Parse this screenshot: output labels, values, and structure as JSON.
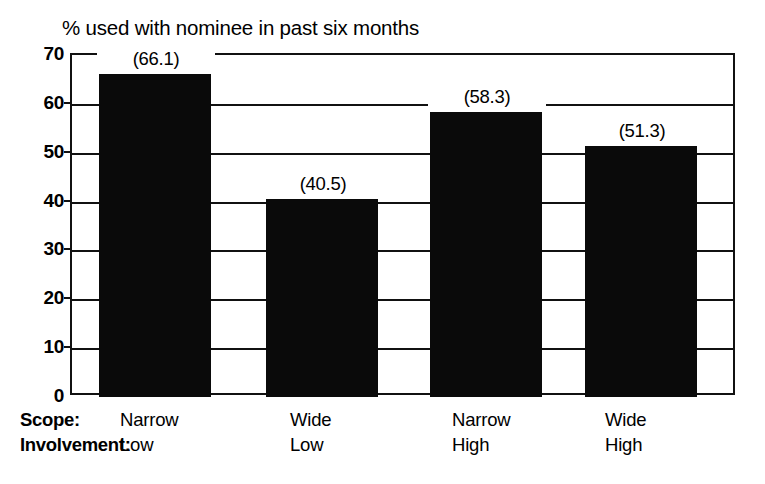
{
  "chart_data": {
    "type": "bar",
    "title": "% used with nominee in past six months",
    "xlabel": "",
    "ylabel": "",
    "ylim": [
      0,
      70
    ],
    "grid": true,
    "legend": "none",
    "orientation": "vertical",
    "bar_color": "#0a0a0a",
    "categories": [
      "Narrow Low",
      "Wide Low",
      "Narrow High",
      "Wide High"
    ],
    "values": [
      66.1,
      40.5,
      58.3,
      51.3
    ],
    "data_labels": [
      "(66.1)",
      "(40.5)",
      "(58.3)",
      "(51.3)"
    ],
    "yticks": [
      70,
      60,
      50,
      40,
      30,
      20,
      10,
      0
    ],
    "ytick_labels": [
      "70",
      "60",
      "50",
      "40",
      "30",
      "20",
      "10",
      "0"
    ],
    "group_rows": [
      {
        "label": "Scope:",
        "values": [
          "Narrow",
          "Wide",
          "Narrow",
          "Wide"
        ]
      },
      {
        "label": "Involvement:",
        "values": [
          "Low",
          "Low",
          "High",
          "High"
        ]
      }
    ]
  },
  "colors": {
    "bar": "#0a0a0a",
    "axis": "#111111",
    "background": "#ffffff",
    "text": "#000000"
  }
}
